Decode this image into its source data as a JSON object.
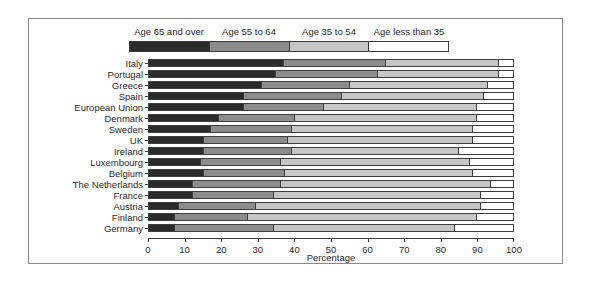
{
  "chart_data": {
    "type": "bar",
    "orientation": "horizontal",
    "stacked": true,
    "title": "",
    "xlabel": "Percentage",
    "ylabel": "",
    "xlim": [
      0,
      100
    ],
    "xticks": [
      0,
      10,
      20,
      30,
      40,
      50,
      60,
      70,
      80,
      90,
      100
    ],
    "grid": false,
    "legend_position": "top",
    "categories": [
      "Italy",
      "Portugal",
      "Greece",
      "Spain",
      "European Union",
      "Denmark",
      "Sweden",
      "UK",
      "Ireland",
      "Luxembourg",
      "Belgium",
      "The Netherlands",
      "France",
      "Austria",
      "Finland",
      "Germany"
    ],
    "series": [
      {
        "name": "Age 65 and over",
        "color": "#2b2b2b",
        "values": [
          37,
          35,
          31,
          26,
          26,
          19,
          17,
          15,
          15,
          14,
          15,
          12,
          12,
          8,
          7,
          7
        ]
      },
      {
        "name": "Age 55 to 64",
        "color": "#8c8c8c",
        "values": [
          28,
          28,
          24,
          27,
          22,
          21,
          22,
          23,
          24,
          22,
          22,
          24,
          22,
          21,
          20,
          27
        ]
      },
      {
        "name": "Age 35 to 54",
        "color": "#c6c6c6",
        "values": [
          31,
          33,
          38,
          39,
          42,
          50,
          50,
          51,
          46,
          52,
          52,
          58,
          57,
          62,
          63,
          50
        ]
      },
      {
        "name": "Age less than 35",
        "color": "#ffffff",
        "values": [
          4,
          4,
          7,
          8,
          10,
          10,
          11,
          11,
          15,
          12,
          11,
          6,
          9,
          9,
          10,
          16
        ]
      }
    ]
  },
  "legend": {
    "items": [
      {
        "label": "Age 65 and over",
        "color": "#2b2b2b"
      },
      {
        "label": "Age 55 to 64",
        "color": "#8c8c8c"
      },
      {
        "label": "Age 35 to 54",
        "color": "#c6c6c6"
      },
      {
        "label": "Age less than 35",
        "color": "#ffffff"
      }
    ]
  },
  "axis": {
    "x_title": "Percentage",
    "x_tick_labels": [
      "0",
      "10",
      "20",
      "30",
      "40",
      "50",
      "60",
      "70",
      "80",
      "90",
      "100"
    ]
  }
}
